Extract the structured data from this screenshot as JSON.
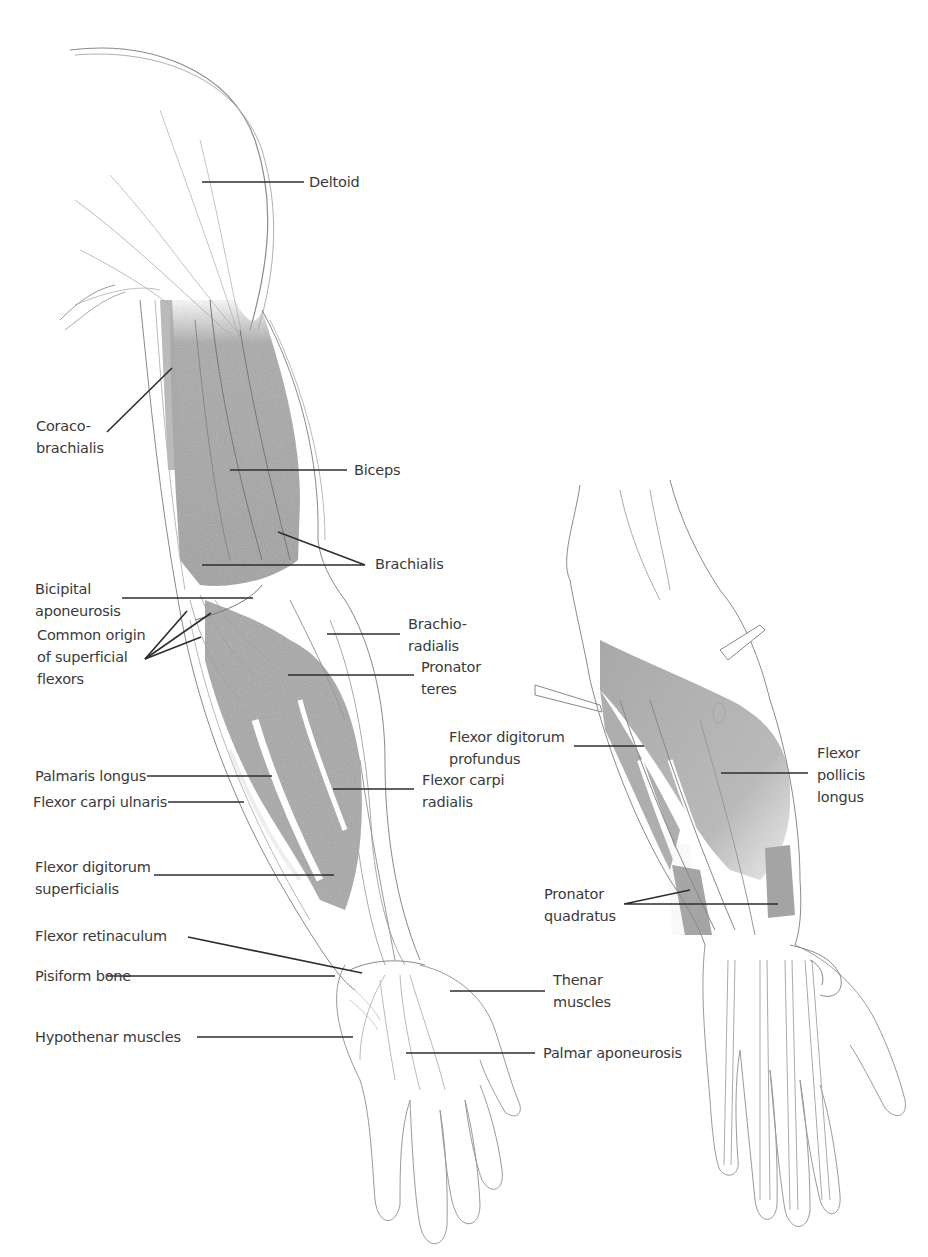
{
  "figure": {
    "views": [
      "superficial-view",
      "deep-forearm-view"
    ]
  },
  "labels": {
    "deltoid": "Deltoid",
    "coracobrachialis": "Coraco-\nbrachialis",
    "biceps": "Biceps",
    "brachialis": "Brachialis",
    "bicipital_aponeurosis": "Bicipital\naponeurosis",
    "common_origin": "Common origin\nof superficial\nflexors",
    "brachioradialis": "Brachio-\nradialis",
    "pronator_teres": "Pronator\nteres",
    "palmaris_longus": "Palmaris longus",
    "flexor_carpi_ulnaris": "Flexor carpi ulnaris",
    "flexor_carpi_radialis": "Flexor carpi\nradialis",
    "flexor_digitorum_superficialis": "Flexor digitorum\nsuperficialis",
    "flexor_retinaculum": "Flexor retinaculum",
    "pisiform_bone": "Pisiform bone",
    "hypothenar_muscles": "Hypothenar muscles",
    "thenar_muscles": "Thenar\nmuscles",
    "palmar_aponeurosis": "Palmar aponeurosis",
    "flexor_digitorum_profundus": "Flexor digitorum\nprofundus",
    "flexor_pollicis_longus": "Flexor\npollicis\nlongus",
    "pronator_quadratus": "Pronator\nquadratus"
  },
  "colors": {
    "background": "#ffffff",
    "muscle_shade": "#9a9a9a",
    "outline": "#8a8a8a",
    "leader_line": "#2e2e2e",
    "text": "#3a3a3a"
  }
}
